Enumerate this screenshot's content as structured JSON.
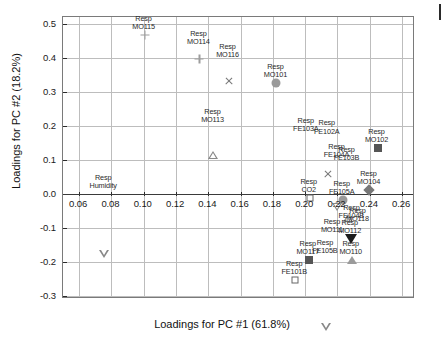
{
  "chart_data": {
    "type": "scatter",
    "title": "",
    "xlabel": "Loadings for PC #1 (61.8%)",
    "ylabel": "Loadings for PC #2 (18.2%)",
    "xlim": [
      0.05,
      0.268
    ],
    "ylim": [
      -0.31,
      0.52
    ],
    "xticks": [
      "0.06",
      "0.08",
      "0.10",
      "0.12",
      "0.14",
      "0.16",
      "0.18",
      "0.20",
      "0.22",
      "0.24",
      "0.26"
    ],
    "xtick_values": [
      0.06,
      0.08,
      0.1,
      0.12,
      0.14,
      0.16,
      0.18,
      0.2,
      0.22,
      0.24,
      0.26
    ],
    "yticks": [
      "0.5",
      "0.4",
      "0.3",
      "0.2",
      "0.1",
      "0.0",
      "-0.1",
      "-0.2",
      "-0.3"
    ],
    "ytick_values": [
      0.5,
      0.4,
      0.3,
      0.2,
      0.1,
      0.0,
      -0.1,
      -0.2,
      -0.3
    ],
    "grid": true,
    "legend": "none",
    "points": [
      {
        "label": "Resp\nMO115",
        "label_line1": "Resp",
        "label_line2": "MO115",
        "x": 0.1005,
        "y": 0.468,
        "marker": "plus"
      },
      {
        "label": "Resp\nMO114",
        "label_line1": "Resp",
        "label_line2": "MO114",
        "x": 0.1345,
        "y": 0.423,
        "marker": "plus"
      },
      {
        "label": "Resp\nMO116",
        "label_line1": "Resp",
        "label_line2": "MO116",
        "x": 0.1525,
        "y": 0.384,
        "marker": "x"
      },
      {
        "label": "Resp\nMO101",
        "label_line1": "Resp",
        "label_line2": "MO101",
        "x": 0.1822,
        "y": 0.325,
        "marker": "circle-filled"
      },
      {
        "label": "Resp\nMO113",
        "label_line1": "Resp",
        "label_line2": "MO113",
        "x": 0.1432,
        "y": 0.194,
        "marker": "tri-up-open"
      },
      {
        "label": "Resp\nFE103A",
        "label_line1": "Resp",
        "label_line2": "FE103A",
        "x": 0.201,
        "y": 0.168,
        "marker": "none"
      },
      {
        "label": "Resp\nFE102A",
        "label_line1": "Resp",
        "label_line2": "FE102A",
        "x": 0.214,
        "y": 0.16,
        "marker": "x"
      },
      {
        "label": "Resp\nMO102",
        "label_line1": "Resp",
        "label_line2": "MO102",
        "x": 0.2448,
        "y": 0.135,
        "marker": "square-filled"
      },
      {
        "label": "Resp\nFE104A",
        "label_line1": "Resp",
        "label_line2": "FE104A",
        "x": 0.22,
        "y": 0.09,
        "marker": "tri-dn-open"
      },
      {
        "label": "Resp\nFE103B",
        "label_line1": "Resp",
        "label_line2": "FE103B",
        "x": 0.2262,
        "y": 0.082,
        "marker": "tri-up-open"
      },
      {
        "label": "Resp\nMO104",
        "label_line1": "Resp",
        "label_line2": "MO104",
        "x": 0.2398,
        "y": 0.01,
        "marker": "diamond-filled"
      },
      {
        "label": "Resp\nHumidity",
        "label_line1": "Resp",
        "label_line2": "Humidity",
        "x": 0.0755,
        "y": 0.0,
        "marker": "tri-dn-open"
      },
      {
        "label": "Resp\nCO2",
        "label_line1": "Resp",
        "label_line2": "CO2",
        "x": 0.2028,
        "y": -0.012,
        "marker": "square-open"
      },
      {
        "label": "Resp\nFE105A",
        "label_line1": "Resp",
        "label_line2": "FE105A",
        "x": 0.2232,
        "y": -0.018,
        "marker": "circle-filled"
      },
      {
        "label": "Resp\nFE104B",
        "label_line1": "Resp",
        "label_line2": "FE104B",
        "x": 0.2292,
        "y": -0.09,
        "marker": "none"
      },
      {
        "label": "Resp\nMO118",
        "label_line1": "Resp",
        "label_line2": "MO118",
        "x": 0.233,
        "y": -0.098,
        "marker": "none"
      },
      {
        "label": "Resp\nMO111",
        "label_line1": "Resp",
        "label_line2": "MO111",
        "x": 0.2172,
        "y": -0.13,
        "marker": "none"
      },
      {
        "label": "Resp\nMO112",
        "label_line1": "Resp",
        "label_line2": "MO112",
        "x": 0.2282,
        "y": -0.133,
        "marker": "tri-dn-filled"
      },
      {
        "label": "Resp\nMO110",
        "label_line1": "Resp",
        "label_line2": "MO110",
        "x": 0.2288,
        "y": -0.195,
        "marker": "tri-up-filled"
      },
      {
        "label": "Resp\nFE105B",
        "label_line1": "Resp",
        "label_line2": "FE105B",
        "x": 0.2128,
        "y": -0.192,
        "marker": "tri-dn-open"
      },
      {
        "label": "Resp\nMO117",
        "label_line1": "Resp",
        "label_line2": "MO117",
        "x": 0.2022,
        "y": -0.196,
        "marker": "square-filled"
      },
      {
        "label": "Resp\nFE101B",
        "label_line1": "Resp",
        "label_line2": "FE101B",
        "x": 0.1938,
        "y": -0.253,
        "marker": "square-open"
      }
    ]
  }
}
